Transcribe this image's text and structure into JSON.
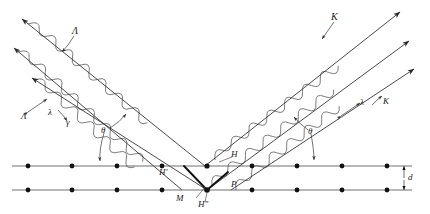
{
  "figure": {
    "background": "#ffffff",
    "ink": "#2b2b2b",
    "width": 430,
    "height": 214
  },
  "labels": {
    "lambda_capital_incident": "Λ",
    "lambda_small_incident": "λ",
    "gamma_incident": "γ",
    "wave_incident_group": "Λ",
    "wave_outgoing_group": "K",
    "lambda_small_outgoing": "λ",
    "K_outgoing": "K",
    "theta_left": "θ",
    "theta_right": "θ",
    "point_H_prime": "H′",
    "point_H": "H",
    "point_H_double_prime": "H″",
    "point_M": "M",
    "point_P": "P",
    "spacing_d": "d"
  },
  "lattice": {
    "rows": [
      {
        "name": "upper-plane",
        "y": 166,
        "x_positions": [
          28,
          72,
          117,
          162,
          207,
          252,
          297,
          342,
          387
        ]
      },
      {
        "name": "lower-plane",
        "y": 190,
        "x_positions": [
          28,
          72,
          117,
          162,
          207,
          252,
          297,
          342,
          387
        ]
      }
    ],
    "line_x_start": 12,
    "line_x_end": 412,
    "dot_radius": 2.4,
    "spacing_label": "d"
  },
  "beams": {
    "incident": [
      {
        "name": "incident-ray-1",
        "x1": 20,
        "y1": 18,
        "x2": 205,
        "y2": 166
      },
      {
        "name": "incident-ray-2",
        "x1": 12,
        "y1": 47,
        "x2": 180,
        "y2": 190
      },
      {
        "name": "incident-ray-3",
        "x1": 30,
        "y1": 76,
        "x2": 205,
        "y2": 190
      }
    ],
    "outgoing": [
      {
        "name": "outgoing-ray-1",
        "x1": 205,
        "y1": 166,
        "x2": 400,
        "y2": 12
      },
      {
        "name": "outgoing-ray-2",
        "x1": 207,
        "y1": 190,
        "x2": 408,
        "y2": 40
      },
      {
        "name": "outgoing-ray-3",
        "x1": 230,
        "y1": 190,
        "x2": 412,
        "y2": 68
      }
    ],
    "wave_amplitude": 8.5,
    "wave_period": 22
  },
  "markers": {
    "theta_left": {
      "x": 104,
      "y": 140
    },
    "theta_right": {
      "x": 312,
      "y": 140
    },
    "d_arrow_x": 404
  }
}
